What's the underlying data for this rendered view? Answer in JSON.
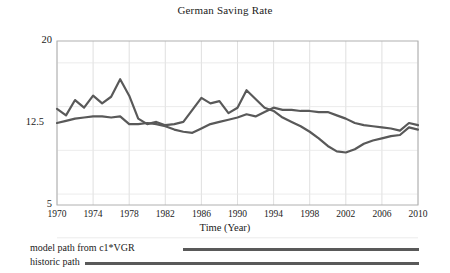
{
  "chart_data": {
    "type": "line",
    "title": "German Saving Rate",
    "xlabel": "Time (Year)",
    "ylabel": "",
    "grid": true,
    "legend_position": "below",
    "xlim": [
      1970,
      2010
    ],
    "ylim": [
      5,
      20
    ],
    "xticks": [
      1970,
      1974,
      1978,
      1982,
      1986,
      1990,
      1994,
      1998,
      2002,
      2006,
      2010
    ],
    "yticks": [
      20,
      12.5,
      5
    ],
    "x": [
      1970,
      1971,
      1972,
      1973,
      1974,
      1975,
      1976,
      1977,
      1978,
      1979,
      1980,
      1981,
      1982,
      1983,
      1984,
      1985,
      1986,
      1987,
      1988,
      1989,
      1990,
      1991,
      1992,
      1993,
      1994,
      1995,
      1996,
      1997,
      1998,
      1999,
      2000,
      2001,
      2002,
      2003,
      2004,
      2005,
      2006,
      2007,
      2008,
      2009,
      2010
    ],
    "series": [
      {
        "name": "model path from  c1*VGR",
        "color": "#595959",
        "values": [
          13.8,
          13.2,
          14.6,
          13.9,
          15.0,
          14.3,
          14.9,
          16.5,
          15.0,
          12.9,
          12.4,
          12.6,
          12.3,
          12.4,
          12.6,
          13.7,
          14.8,
          14.3,
          14.5,
          13.4,
          13.9,
          15.5,
          14.7,
          13.9,
          13.6,
          13.0,
          12.6,
          12.2,
          11.7,
          11.1,
          10.4,
          9.9,
          9.8,
          10.1,
          10.6,
          10.9,
          11.1,
          11.3,
          11.4,
          12.1,
          11.9
        ]
      },
      {
        "name": "historic path",
        "color": "#595959",
        "values": [
          12.5,
          12.7,
          12.9,
          13.0,
          13.1,
          13.1,
          13.0,
          13.1,
          12.4,
          12.4,
          12.5,
          12.4,
          12.2,
          11.9,
          11.7,
          11.6,
          12.0,
          12.4,
          12.6,
          12.8,
          13.0,
          13.3,
          13.1,
          13.5,
          13.9,
          13.7,
          13.7,
          13.6,
          13.6,
          13.5,
          13.5,
          13.2,
          12.9,
          12.5,
          12.3,
          12.2,
          12.1,
          12.0,
          11.8,
          12.5,
          12.3
        ]
      }
    ]
  },
  "legend": {
    "items": [
      {
        "label": "model path from  c1*VGR"
      },
      {
        "label": "historic path"
      }
    ]
  }
}
